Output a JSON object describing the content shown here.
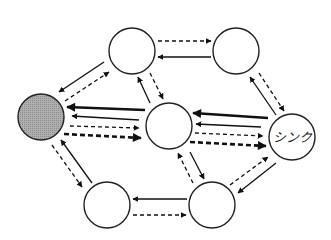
{
  "diagram": {
    "type": "flow-network",
    "nodes": [
      {
        "id": "source",
        "label": "",
        "x": 41,
        "y": 117,
        "r": 23,
        "fill": "#a9a9a9",
        "shaded": true
      },
      {
        "id": "top-left",
        "label": "",
        "x": 132,
        "y": 51,
        "r": 23,
        "fill": "#ffffff"
      },
      {
        "id": "top-right",
        "label": "",
        "x": 236,
        "y": 51,
        "r": 23,
        "fill": "#ffffff"
      },
      {
        "id": "center",
        "label": "",
        "x": 169,
        "y": 126,
        "r": 23,
        "fill": "#ffffff"
      },
      {
        "id": "sink",
        "label": "シンク",
        "x": 292,
        "y": 137,
        "r": 23,
        "fill": "#ffffff"
      },
      {
        "id": "bottom-left",
        "label": "",
        "x": 107,
        "y": 205,
        "r": 23,
        "fill": "#ffffff"
      },
      {
        "id": "bottom-right",
        "label": "",
        "x": 212,
        "y": 205,
        "r": 23,
        "fill": "#ffffff"
      }
    ],
    "edges": [
      {
        "from": "top-left",
        "to": "top-right",
        "style": "dashed",
        "weight": 1.3,
        "x1": 158,
        "y1": 41,
        "x2": 211,
        "y2": 41
      },
      {
        "from": "top-right",
        "to": "top-left",
        "style": "solid",
        "weight": 1.3,
        "x1": 211,
        "y1": 57,
        "x2": 158,
        "y2": 57
      },
      {
        "from": "top-left",
        "to": "source",
        "style": "solid",
        "weight": 1.3,
        "x1": 104,
        "y1": 62,
        "x2": 59,
        "y2": 92
      },
      {
        "from": "source",
        "to": "top-left",
        "style": "dashed",
        "weight": 1.3,
        "x1": 65,
        "y1": 101,
        "x2": 109,
        "y2": 72
      },
      {
        "from": "center",
        "to": "top-left",
        "style": "solid",
        "weight": 1.3,
        "x1": 150,
        "y1": 103,
        "x2": 138,
        "y2": 77
      },
      {
        "from": "top-left",
        "to": "center",
        "style": "dashed",
        "weight": 1.3,
        "x1": 150,
        "y1": 73,
        "x2": 163,
        "y2": 99
      },
      {
        "from": "sink",
        "to": "top-right",
        "style": "solid",
        "weight": 1.3,
        "x1": 276,
        "y1": 115,
        "x2": 250,
        "y2": 77
      },
      {
        "from": "top-right",
        "to": "sink",
        "style": "dashed",
        "weight": 1.3,
        "x1": 259,
        "y1": 73,
        "x2": 284,
        "y2": 111
      },
      {
        "from": "center",
        "to": "source",
        "style": "solid",
        "weight": 2.6,
        "x1": 145,
        "y1": 110,
        "x2": 67,
        "y2": 107
      },
      {
        "from": "center",
        "to": "source",
        "style": "solid",
        "weight": 1.3,
        "x1": 139,
        "y1": 120,
        "x2": 72,
        "y2": 116
      },
      {
        "from": "source",
        "to": "center",
        "style": "dashed",
        "weight": 1.3,
        "x1": 70,
        "y1": 126,
        "x2": 139,
        "y2": 128
      },
      {
        "from": "source",
        "to": "center",
        "style": "dashed",
        "weight": 2.6,
        "x1": 64,
        "y1": 134,
        "x2": 141,
        "y2": 138
      },
      {
        "from": "sink",
        "to": "center",
        "style": "solid",
        "weight": 2.6,
        "x1": 268,
        "y1": 118,
        "x2": 193,
        "y2": 113
      },
      {
        "from": "sink",
        "to": "center",
        "style": "solid",
        "weight": 1.3,
        "x1": 261,
        "y1": 127,
        "x2": 196,
        "y2": 124
      },
      {
        "from": "center",
        "to": "sink",
        "style": "dashed",
        "weight": 1.3,
        "x1": 195,
        "y1": 133,
        "x2": 263,
        "y2": 136
      },
      {
        "from": "center",
        "to": "sink",
        "style": "dashed",
        "weight": 2.6,
        "x1": 190,
        "y1": 142,
        "x2": 266,
        "y2": 146
      },
      {
        "from": "bottom-right",
        "to": "center",
        "style": "dashed",
        "weight": 1.3,
        "x1": 193,
        "y1": 183,
        "x2": 178,
        "y2": 153
      },
      {
        "from": "center",
        "to": "bottom-right",
        "style": "solid",
        "weight": 1.3,
        "x1": 190,
        "y1": 152,
        "x2": 204,
        "y2": 179
      },
      {
        "from": "bottom-right",
        "to": "sink",
        "style": "dashed",
        "weight": 1.3,
        "x1": 230,
        "y1": 185,
        "x2": 268,
        "y2": 157
      },
      {
        "from": "sink",
        "to": "bottom-right",
        "style": "solid",
        "weight": 1.3,
        "x1": 276,
        "y1": 163,
        "x2": 238,
        "y2": 193
      },
      {
        "from": "bottom-right",
        "to": "bottom-left",
        "style": "solid",
        "weight": 1.3,
        "x1": 187,
        "y1": 199,
        "x2": 133,
        "y2": 199
      },
      {
        "from": "bottom-left",
        "to": "bottom-right",
        "style": "dashed",
        "weight": 1.3,
        "x1": 133,
        "y1": 215,
        "x2": 186,
        "y2": 215
      },
      {
        "from": "source",
        "to": "bottom-left",
        "style": "dashed",
        "weight": 1.3,
        "x1": 52,
        "y1": 145,
        "x2": 82,
        "y2": 187
      },
      {
        "from": "bottom-left",
        "to": "source",
        "style": "solid",
        "weight": 1.3,
        "x1": 92,
        "y1": 183,
        "x2": 61,
        "y2": 140
      }
    ]
  }
}
